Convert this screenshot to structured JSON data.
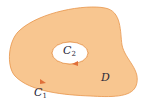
{
  "diagram": {
    "region_label": "D",
    "outer_curve": {
      "name": "C",
      "subscript": "1"
    },
    "inner_curve": {
      "name": "C",
      "subscript": "2"
    },
    "colors": {
      "fill": "#F8C690",
      "stroke": "#E7944A",
      "hole": "#FFFFFF",
      "arrow": "#E0703A",
      "text": "#2A2A3A"
    }
  }
}
